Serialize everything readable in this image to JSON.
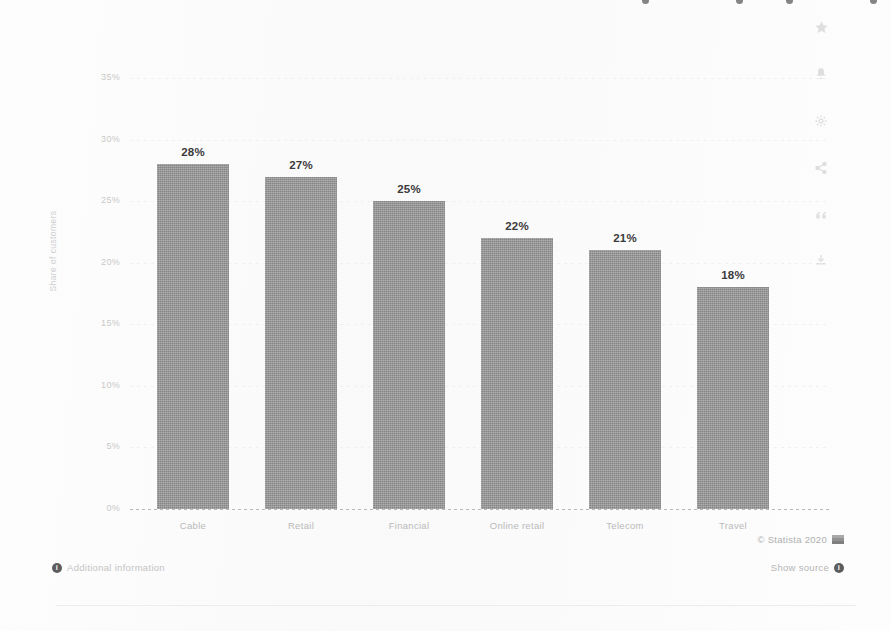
{
  "chart_data": {
    "type": "bar",
    "title": "",
    "xlabel": "",
    "ylabel": "Share of customers",
    "categories": [
      "Cable",
      "Retail",
      "Financial",
      "Online retail",
      "Telecom",
      "Travel"
    ],
    "values": [
      28,
      27,
      25,
      22,
      21,
      18
    ],
    "value_labels": [
      "28%",
      "27%",
      "25%",
      "22%",
      "21%",
      "18%"
    ],
    "ylim": [
      0,
      35
    ],
    "ytick_values": [
      0,
      5,
      10,
      15,
      20,
      25,
      30,
      35
    ],
    "ytick_labels": [
      "0%",
      "5%",
      "10%",
      "15%",
      "20%",
      "25%",
      "30%",
      "35%"
    ],
    "grid": true,
    "legend": "none",
    "bar_color": "#8e8e8e",
    "label_color": "#3a3a3a"
  },
  "footer": {
    "copyright": "© Statista 2020",
    "additional_information": "Additional information",
    "show_source": "Show source",
    "info_glyph": "i"
  },
  "icon_rail": {
    "items": [
      {
        "name": "star-icon"
      },
      {
        "name": "bell-icon"
      },
      {
        "name": "gear-icon"
      },
      {
        "name": "share-icon"
      },
      {
        "name": "quote-icon"
      },
      {
        "name": "download-icon"
      }
    ]
  }
}
